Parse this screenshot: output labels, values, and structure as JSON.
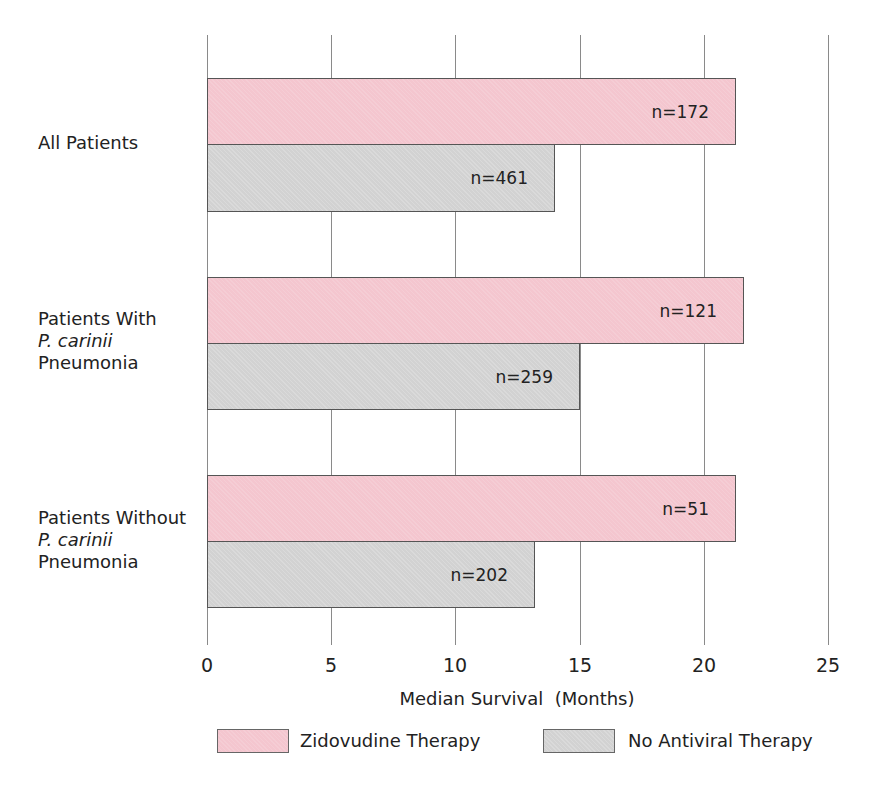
{
  "chart_data": {
    "type": "bar",
    "orientation": "horizontal",
    "title": "",
    "xlabel": "Median Survival  (Months)",
    "ylabel": "",
    "xlim": [
      0,
      25
    ],
    "xticks": [
      0,
      5,
      10,
      15,
      20,
      25
    ],
    "grid": true,
    "legend_position": "bottom",
    "categories": [
      "All Patients",
      "Patients With P. carinii Pneumonia",
      "Patients Without P. carinii Pneumonia"
    ],
    "series": [
      {
        "name": "Zidovudine Therapy",
        "color": "#f4c6cf",
        "values": [
          21.3,
          21.6,
          21.3
        ],
        "n_labels": [
          "n=172",
          "n=121",
          "n=51"
        ]
      },
      {
        "name": "No Antiviral Therapy",
        "color": "#d2d2d2",
        "values": [
          14.0,
          15.0,
          13.2
        ],
        "n_labels": [
          "n=461",
          "n=259",
          "n=202"
        ]
      }
    ]
  },
  "labels": {
    "group1": {
      "line1": "All Patients"
    },
    "group2": {
      "line1": "Patients With",
      "line2": "P. carinii",
      "line3": "Pneumonia"
    },
    "group3": {
      "line1": "Patients Without",
      "line2": "P. carinii",
      "line3": "Pneumonia"
    }
  },
  "ticks": [
    "0",
    "5",
    "10",
    "15",
    "20",
    "25"
  ],
  "legend": {
    "item1": "Zidovudine Therapy",
    "item2": "No Antiviral Therapy"
  }
}
